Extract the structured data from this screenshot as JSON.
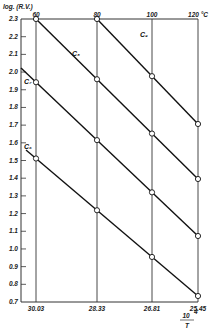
{
  "chart_data": {
    "type": "line",
    "title": "",
    "ylabel": "log. (R.V.)",
    "xlabel": "10^4 / T",
    "ylim": [
      0.7,
      2.3
    ],
    "y_ticks": [
      "2.3",
      "2.2",
      "2.1",
      "2.0",
      "1.9",
      "1.8",
      "1.7",
      "1.6",
      "1.5",
      "1.4",
      "1.3",
      "1.2",
      "1.1",
      "1.0",
      "0.9",
      "0.8",
      "0.7"
    ],
    "x_ticks_bottom": [
      "30.03",
      "28.33",
      "26.81",
      "25.45"
    ],
    "x_ticks_top": [
      "60",
      "80",
      "100",
      "120 °C"
    ],
    "grid": "vertical lines at each x tick",
    "x": [
      30.03,
      28.33,
      26.81,
      25.45
    ],
    "series": [
      {
        "name": "C9",
        "values": [
          null,
          2.3,
          2.0,
          1.71
        ]
      },
      {
        "name": "C8",
        "values": [
          2.3,
          1.96,
          1.69,
          1.4
        ]
      },
      {
        "name": "C7",
        "values": [
          1.97,
          1.66,
          1.33,
          1.07
        ]
      },
      {
        "name": "C6",
        "values": [
          1.53,
          1.21,
          0.99,
          0.74
        ]
      }
    ],
    "legend": "inline labels near line starts"
  },
  "labels": {
    "ylabel": "log. (R.V.)",
    "xlabel_num": "10",
    "xlabel_exp": "4",
    "xlabel_den": "T"
  }
}
